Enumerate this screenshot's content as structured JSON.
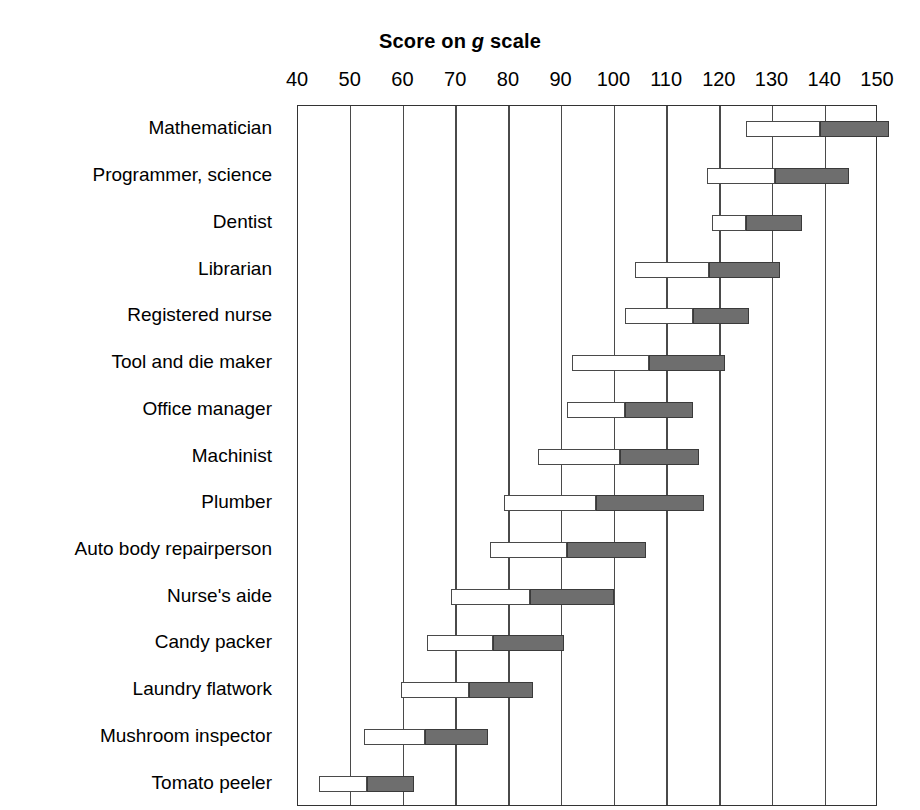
{
  "chart": {
    "title_prefix": "Score on ",
    "title_italic": "g",
    "title_suffix": " scale"
  },
  "chart_data": {
    "type": "bar",
    "title": "Score on g scale",
    "subtitle": "",
    "xlabel": "Score on g scale",
    "ylabel": "",
    "xlim": [
      40,
      150
    ],
    "ylim": [
      0,
      15
    ],
    "grid": true,
    "legend_position": "none",
    "orientation": "horizontal",
    "bar_style": "range-bar-two-segment",
    "annotation": "Each occupation shows a range bar: an open (white) lower segment from the low score to the midpoint, and a filled (gray) upper segment from the midpoint to the high score.",
    "x_ticks": [
      40,
      50,
      60,
      70,
      80,
      90,
      100,
      110,
      120,
      130,
      140,
      150
    ],
    "x_tick_labels": [
      "40",
      "50",
      "60",
      "70",
      "80",
      "90",
      "100",
      "110",
      "120",
      "130",
      "140",
      "150"
    ],
    "categories": [
      "Mathematician",
      "Programmer, science",
      "Dentist",
      "Librarian",
      "Registered nurse",
      "Tool and die maker",
      "Office manager",
      "Machinist",
      "Plumber",
      "Auto body repairperson",
      "Nurse's aide",
      "Candy packer",
      "Laundry flatwork",
      "Mushroom inspector",
      "Tomato peeler"
    ],
    "series": [
      {
        "name": "Lower range (open segment)",
        "color": "#ffffff",
        "low": [
          125,
          117.5,
          118.5,
          104,
          102,
          92,
          91,
          85.5,
          79,
          76.5,
          69,
          64.5,
          59.5,
          52.5,
          44
        ],
        "mid": [
          139,
          130.5,
          125,
          118,
          115,
          106.5,
          102,
          101,
          96.5,
          91,
          84,
          77,
          72.5,
          64,
          53
        ]
      },
      {
        "name": "Upper range (filled segment)",
        "color": "#6e6e6e",
        "mid": [
          139,
          130.5,
          125,
          118,
          115,
          106.5,
          102,
          101,
          96.5,
          91,
          84,
          77,
          72.5,
          64,
          53
        ],
        "high": [
          152,
          144.5,
          135.5,
          131.5,
          125.5,
          121,
          115,
          116,
          117,
          106,
          100,
          90.5,
          84.5,
          76,
          62
        ]
      }
    ],
    "rows": [
      {
        "category": "Mathematician",
        "low": 125,
        "mid": 139,
        "high": 152
      },
      {
        "category": "Programmer, science",
        "low": 117.5,
        "mid": 130.5,
        "high": 144.5
      },
      {
        "category": "Dentist",
        "low": 118.5,
        "mid": 125,
        "high": 135.5
      },
      {
        "category": "Librarian",
        "low": 104,
        "mid": 118,
        "high": 131.5
      },
      {
        "category": "Registered nurse",
        "low": 102,
        "mid": 115,
        "high": 125.5
      },
      {
        "category": "Tool and die maker",
        "low": 92,
        "mid": 106.5,
        "high": 121
      },
      {
        "category": "Office manager",
        "low": 91,
        "mid": 102,
        "high": 115
      },
      {
        "category": "Machinist",
        "low": 85.5,
        "mid": 101,
        "high": 116
      },
      {
        "category": "Plumber",
        "low": 79,
        "mid": 96.5,
        "high": 117
      },
      {
        "category": "Auto body repairperson",
        "low": 76.5,
        "mid": 91,
        "high": 106
      },
      {
        "category": "Nurse's aide",
        "low": 69,
        "mid": 84,
        "high": 100
      },
      {
        "category": "Candy packer",
        "low": 64.5,
        "mid": 77,
        "high": 90.5
      },
      {
        "category": "Laundry flatwork",
        "low": 59.5,
        "mid": 72.5,
        "high": 84.5
      },
      {
        "category": "Mushroom inspector",
        "low": 52.5,
        "mid": 64,
        "high": 76
      },
      {
        "category": "Tomato peeler",
        "low": 44,
        "mid": 53,
        "high": 62
      }
    ],
    "colors": {
      "low_segment": "#ffffff",
      "high_segment": "#6e6e6e",
      "axis": "#333333",
      "grid": "#4a4a4a",
      "background": "#ffffff",
      "text": "#000000"
    }
  }
}
